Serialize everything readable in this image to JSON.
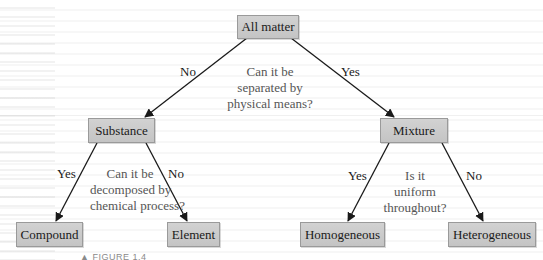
{
  "diagram": {
    "type": "decision-tree",
    "root": {
      "label": "All matter",
      "question": [
        "Can it be",
        "separated by",
        "physical means?"
      ],
      "edges": {
        "left": "No",
        "right": "Yes"
      }
    },
    "left": {
      "label": "Substance",
      "question": [
        "Can it be",
        "decomposed by",
        "chemical process?"
      ],
      "edges": {
        "left": "Yes",
        "right": "No"
      },
      "children": [
        "Compound",
        "Element"
      ]
    },
    "right": {
      "label": "Mixture",
      "question": [
        "Is it",
        "uniform",
        "throughout?"
      ],
      "edges": {
        "left": "Yes",
        "right": "No"
      },
      "children": [
        "Homogeneous",
        "Heterogeneous"
      ]
    },
    "caption": "▲ FIGURE 1.4",
    "colors": {
      "node_fill": "#cbcbcb",
      "node_border": "#9a9a9a",
      "arrow": "#1a1a1a",
      "question_text": "#555555"
    }
  }
}
